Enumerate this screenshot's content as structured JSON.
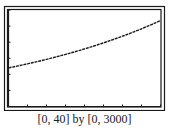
{
  "chart_data": {
    "type": "line",
    "title": "",
    "xlabel": "",
    "ylabel": "",
    "xlim": [
      0,
      40
    ],
    "ylim": [
      0,
      3000
    ],
    "x_tick_step": 5,
    "y_tick_step": 500,
    "grid": false,
    "legend": null,
    "series": [
      {
        "name": "y",
        "x": [
          0,
          5,
          10,
          15,
          20,
          25,
          30,
          35,
          40
        ],
        "values": [
          1200,
          1326,
          1466,
          1620,
          1790,
          1979,
          2187,
          2417,
          2670
        ]
      }
    ],
    "caption": "[0, 40] by [0, 3000]"
  },
  "caption": "[0, 40] by [0, 3000]",
  "colors": {
    "frame": "#1a1a1a",
    "curve": "#1a1a1a",
    "background": "#ffffff"
  }
}
